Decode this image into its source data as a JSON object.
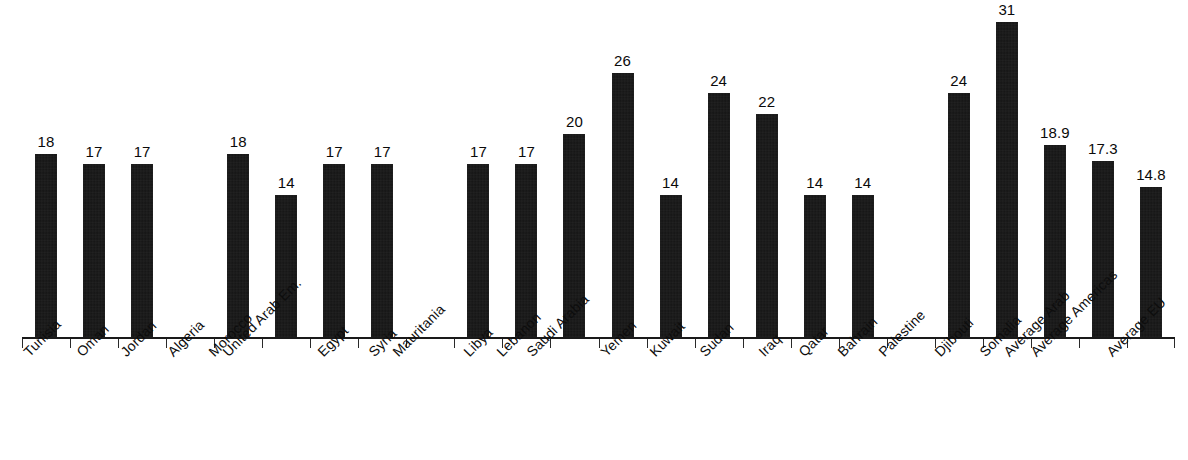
{
  "chart_data": {
    "type": "bar",
    "title": "",
    "subtitle": "",
    "xlabel": "",
    "ylabel": "",
    "ylim": [
      0,
      33
    ],
    "grid": false,
    "legend": null,
    "axis": {
      "baseline_visible": true,
      "y_axis_visible": false,
      "tick_marks": "between-categories",
      "tick_labels_visible": false
    },
    "value_labels": true,
    "bar_color": "#141414",
    "background_color": "#ffffff",
    "categories": [
      "Tunisia",
      "Oman",
      "Jordan",
      "Algeria",
      "Morocco",
      "United Arab Em.",
      "Egypt",
      "Syria",
      "Mauritania",
      "Libya",
      "Lebanon",
      "Saudi Arabia",
      "Yemen",
      "Kuwait",
      "Sudan",
      "Iraq",
      "Qatar",
      "Bahrain",
      "Palestine",
      "Djibouti",
      "Somalia",
      "Average Arab",
      "Average Americas",
      "Average EU"
    ],
    "values": [
      18,
      17,
      17,
      null,
      18,
      14,
      17,
      17,
      null,
      17,
      17,
      20,
      26,
      14,
      24,
      22,
      14,
      14,
      null,
      24,
      31,
      18.9,
      17.3,
      14.8
    ],
    "value_label_texts": [
      "18",
      "17",
      "17",
      "",
      "18",
      "14",
      "17",
      "17",
      "",
      "17",
      "17",
      "20",
      "26",
      "14",
      "24",
      "22",
      "14",
      "14",
      "",
      "24",
      "31",
      "18.9",
      "17.3",
      "14.8"
    ]
  }
}
